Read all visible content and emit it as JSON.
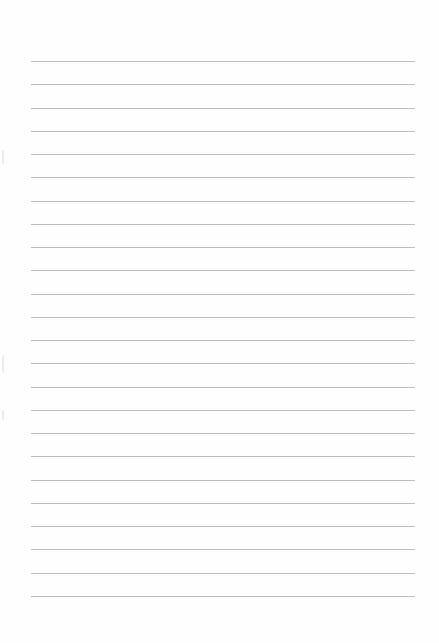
{
  "document": {
    "type": "lined-paper",
    "line_count": 24,
    "line_color": "#bdbdbd",
    "paper_color": "#fefefe",
    "text": ""
  }
}
